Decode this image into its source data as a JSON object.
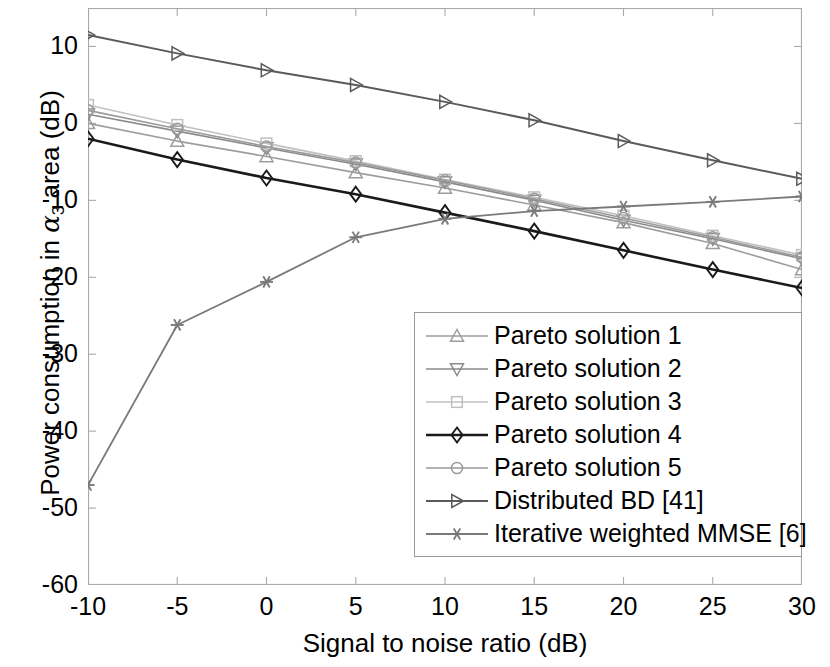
{
  "chart_data": {
    "type": "line",
    "title": "",
    "xlabel": "Signal to noise ratio (dB)",
    "ylabel": "Power consumption in α_3 area (dB)",
    "ylabel_prefix": "Power consumption in ",
    "ylabel_alpha": "α",
    "ylabel_sub": "3",
    "ylabel_suffix": " area (dB)",
    "x": [
      -10,
      -5,
      0,
      5,
      10,
      15,
      20,
      25,
      30
    ],
    "xticks": [
      "-10",
      "-5",
      "0",
      "5",
      "10",
      "15",
      "20",
      "25",
      "30"
    ],
    "yticks": [
      "10",
      "0",
      "-10",
      "-20",
      "-30",
      "-40",
      "-50",
      "-60"
    ],
    "xlim": [
      -10,
      30
    ],
    "ylim": [
      -60,
      15
    ],
    "grid": false,
    "legend_position": "lower right",
    "series": [
      {
        "name": "Pareto solution 1",
        "marker": "triangle-up",
        "color": "#9d9d9d",
        "width": 1.6,
        "values": [
          0.0,
          -2.3,
          -4.3,
          -6.4,
          -8.4,
          -10.6,
          -12.9,
          -15.6,
          -19.0
        ]
      },
      {
        "name": "Pareto solution 2",
        "marker": "triangle-down",
        "color": "#8a8a8a",
        "width": 1.6,
        "values": [
          1.2,
          -1.0,
          -3.2,
          -5.3,
          -7.6,
          -10.0,
          -12.6,
          -15.0,
          -17.6
        ]
      },
      {
        "name": "Pareto solution 3",
        "marker": "square",
        "color": "#c0c0c0",
        "width": 1.6,
        "values": [
          2.4,
          -0.2,
          -2.6,
          -4.9,
          -7.3,
          -9.6,
          -12.0,
          -14.6,
          -17.1
        ]
      },
      {
        "name": "Pareto solution 4",
        "marker": "diamond",
        "color": "#1a1a1a",
        "width": 2.6,
        "values": [
          -2.0,
          -4.7,
          -7.1,
          -9.2,
          -11.6,
          -14.0,
          -16.5,
          -19.0,
          -21.4
        ]
      },
      {
        "name": "Pareto solution 5",
        "marker": "circle",
        "color": "#9a9a9a",
        "width": 1.6,
        "values": [
          1.7,
          -0.7,
          -3.0,
          -5.1,
          -7.4,
          -9.8,
          -12.3,
          -14.8,
          -17.4
        ]
      },
      {
        "name": "Distributed BD [41]",
        "marker": "triangle-right",
        "color": "#5a5a5a",
        "width": 2.0,
        "values": [
          11.5,
          9.1,
          6.9,
          5.0,
          2.8,
          0.4,
          -2.3,
          -4.8,
          -7.2
        ]
      },
      {
        "name": "Iterative weighted MMSE [6]",
        "marker": "asterisk",
        "color": "#7a7a7a",
        "width": 1.8,
        "values": [
          -47.0,
          -26.2,
          -20.6,
          -14.8,
          -12.4,
          -11.4,
          -10.8,
          -10.2,
          -9.5
        ]
      }
    ]
  },
  "legend": {
    "items": [
      "Pareto solution 1",
      "Pareto solution 2",
      "Pareto solution 3",
      "Pareto solution 4",
      "Pareto solution 5",
      "Distributed BD [41]",
      "Iterative weighted MMSE [6]"
    ]
  }
}
